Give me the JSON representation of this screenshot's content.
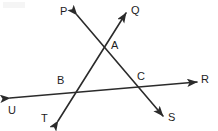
{
  "figure": {
    "width": 218,
    "height": 131,
    "background_color": "#ffffff",
    "stroke_color": "#2b2b2b",
    "label_color": "#1d1d1d",
    "stroke_width": 1.6
  },
  "points": [
    {
      "id": "A",
      "label": "A",
      "type": "intersection",
      "x": 105,
      "y": 45,
      "label_x": 111,
      "label_y": 40
    },
    {
      "id": "B",
      "label": "B",
      "type": "intersection",
      "x": 70,
      "y": 90,
      "label_x": 57,
      "label_y": 75
    },
    {
      "id": "C",
      "label": "C",
      "type": "intersection",
      "x": 137,
      "y": 87,
      "label_x": 137,
      "label_y": 71
    }
  ],
  "endpoints": [
    {
      "id": "P",
      "label": "P",
      "x": 77,
      "y": 15,
      "label_x": 60,
      "label_y": 6
    },
    {
      "id": "Q",
      "label": "Q",
      "x": 126,
      "y": 13,
      "label_x": 131,
      "label_y": 5
    },
    {
      "id": "R",
      "label": "R",
      "x": 197,
      "y": 82,
      "label_x": 201,
      "label_y": 74
    },
    {
      "id": "S",
      "label": "S",
      "x": 163,
      "y": 116,
      "label_x": 168,
      "label_y": 112
    },
    {
      "id": "T",
      "label": "T",
      "x": 58,
      "y": 121,
      "label_x": 41,
      "label_y": 113
    },
    {
      "id": "U",
      "label": "U",
      "x": 10,
      "y": 98,
      "label_x": 8,
      "label_y": 105
    }
  ],
  "lines": [
    {
      "id": "line-TQ",
      "name": "ray-T-through-B-A-to-Q",
      "from": "T",
      "to": "Q",
      "x1": 58,
      "y1": 121,
      "x2": 126,
      "y2": 13,
      "arrow_start": true,
      "arrow_end": true,
      "passes_through": [
        "B",
        "A"
      ]
    },
    {
      "id": "line-PS",
      "name": "ray-P-through-A-C-to-S",
      "from": "P",
      "to": "S",
      "x1": 77,
      "y1": 15,
      "x2": 163,
      "y2": 116,
      "arrow_start": true,
      "arrow_end": true,
      "passes_through": [
        "A",
        "C"
      ]
    },
    {
      "id": "line-UR",
      "name": "transversal-U-through-B-C-to-R",
      "from": "U",
      "to": "R",
      "x1": 10,
      "y1": 98,
      "x2": 197,
      "y2": 82,
      "arrow_start": true,
      "arrow_end": true,
      "passes_through": [
        "B",
        "C"
      ]
    }
  ]
}
